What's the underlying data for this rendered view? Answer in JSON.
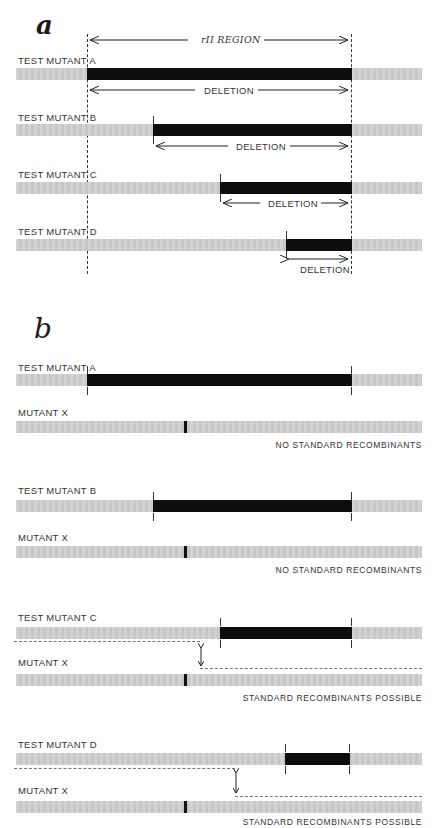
{
  "panel_a": {
    "letter": "a",
    "region_label": "rII REGION",
    "rows": [
      {
        "label": "TEST MUTANT A",
        "deletion_label": "DELETION"
      },
      {
        "label": "TEST MUTANT B",
        "deletion_label": "DELETION"
      },
      {
        "label": "TEST MUTANT C",
        "deletion_label": "DELETION"
      },
      {
        "label": "TEST MUTANT D",
        "deletion_label": "DELETION"
      }
    ]
  },
  "panel_b": {
    "letter": "b",
    "crosses": [
      {
        "test_label": "TEST MUTANT A",
        "x_label": "MUTANT X",
        "result": "NO STANDARD RECOMBINANTS"
      },
      {
        "test_label": "TEST MUTANT B",
        "x_label": "MUTANT X",
        "result": "NO STANDARD RECOMBINANTS"
      },
      {
        "test_label": "TEST MUTANT C",
        "x_label": "MUTANT X",
        "result": "STANDARD RECOMBINANTS POSSIBLE"
      },
      {
        "test_label": "TEST MUTANT D",
        "x_label": "MUTANT X",
        "result": "STANDARD RECOMBINANTS POSSIBLE"
      }
    ]
  },
  "colors": {
    "chromosome": "#cfcfcf",
    "deletion": "#0d0d0d",
    "background": "#ffffff"
  }
}
